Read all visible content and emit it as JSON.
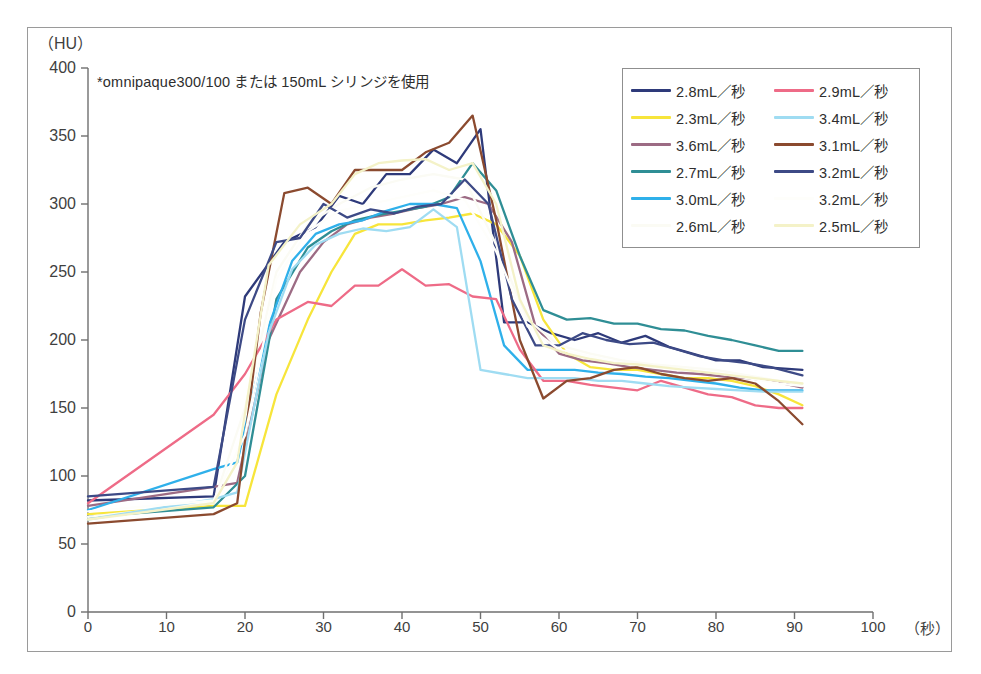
{
  "figure": {
    "annotation": "*omnipaque300/100 または 150mL シリンジを使用",
    "caption": ""
  },
  "chart_data": {
    "type": "line",
    "title": "",
    "xlabel": "（秒）",
    "ylabel": "（HU）",
    "xlim": [
      0,
      100
    ],
    "ylim": [
      0,
      400
    ],
    "xticks": [
      0,
      10,
      20,
      30,
      40,
      50,
      60,
      70,
      80,
      90,
      100
    ],
    "yticks": [
      0,
      50,
      100,
      150,
      200,
      250,
      300,
      350,
      400
    ],
    "grid": false,
    "legend_position": "top-right",
    "legend_columns": 2,
    "series": [
      {
        "name": "2.8mL／秒",
        "color": "#2e3a7a",
        "x": [
          0,
          16,
          20,
          25,
          29,
          32,
          35,
          38,
          41,
          44,
          47,
          50,
          53,
          56,
          59,
          62,
          65,
          68,
          71,
          74,
          77,
          80,
          83,
          86,
          91
        ],
        "y": [
          82,
          85,
          232,
          272,
          283,
          306,
          300,
          322,
          322,
          340,
          330,
          355,
          213,
          213,
          205,
          200,
          205,
          198,
          203,
          195,
          190,
          185,
          185,
          180,
          178
        ]
      },
      {
        "name": "2.3mL／秒",
        "color": "#f7e53b",
        "x": [
          0,
          16,
          20,
          24,
          28,
          31,
          34,
          37,
          40,
          43,
          46,
          49,
          52,
          55,
          58,
          61,
          64,
          67,
          70,
          73,
          76,
          79,
          82,
          85,
          88,
          91
        ],
        "y": [
          72,
          78,
          78,
          160,
          215,
          250,
          278,
          285,
          285,
          288,
          290,
          293,
          285,
          262,
          215,
          190,
          180,
          178,
          178,
          175,
          172,
          172,
          170,
          166,
          160,
          152
        ]
      },
      {
        "name": "3.6mL／秒",
        "color": "#9c6b84",
        "x": [
          0,
          16,
          19,
          23,
          27,
          30,
          33,
          36,
          39,
          42,
          45,
          48,
          51,
          54,
          57,
          60,
          63,
          66,
          69,
          72,
          75,
          78,
          81,
          84,
          87,
          91
        ],
        "y": [
          78,
          92,
          95,
          200,
          250,
          272,
          285,
          290,
          293,
          297,
          300,
          305,
          300,
          272,
          210,
          190,
          185,
          183,
          180,
          178,
          176,
          175,
          173,
          172,
          170,
          165
        ]
      },
      {
        "name": "2.7mL／秒",
        "color": "#2f8e95",
        "x": [
          0,
          16,
          20,
          24,
          28,
          31,
          34,
          37,
          40,
          43,
          46,
          49,
          52,
          55,
          58,
          61,
          64,
          67,
          70,
          73,
          76,
          79,
          82,
          85,
          88,
          91
        ],
        "y": [
          70,
          77,
          100,
          230,
          268,
          280,
          288,
          292,
          295,
          298,
          305,
          330,
          310,
          262,
          222,
          215,
          216,
          212,
          212,
          208,
          207,
          203,
          200,
          196,
          192,
          192
        ]
      },
      {
        "name": "3.0mL／秒",
        "color": "#2fb0ea",
        "x": [
          0,
          16,
          19,
          23,
          26,
          29,
          32,
          35,
          38,
          41,
          44,
          47,
          50,
          53,
          56,
          59,
          62,
          65,
          68,
          71,
          74,
          77,
          80,
          83,
          86,
          91
        ],
        "y": [
          75,
          105,
          110,
          210,
          258,
          278,
          285,
          288,
          295,
          300,
          300,
          297,
          258,
          196,
          178,
          178,
          178,
          176,
          175,
          173,
          172,
          170,
          168,
          165,
          163,
          163
        ]
      },
      {
        "name": "2.6mL／秒",
        "color": "#fbfbf4",
        "x": [
          0,
          16,
          20,
          24,
          28,
          32,
          36,
          40,
          44,
          48,
          52,
          56,
          60,
          64,
          68,
          72,
          76,
          80,
          84,
          88,
          91
        ],
        "y": [
          70,
          80,
          150,
          250,
          285,
          300,
          312,
          318,
          322,
          318,
          270,
          215,
          196,
          190,
          185,
          182,
          180,
          178,
          174,
          170,
          168
        ]
      },
      {
        "name": "2.9mL／秒",
        "color": "#ee6b87",
        "x": [
          0,
          16,
          20,
          24,
          28,
          31,
          34,
          37,
          40,
          43,
          46,
          49,
          52,
          55,
          58,
          61,
          64,
          67,
          70,
          73,
          76,
          79,
          82,
          85,
          88,
          91
        ],
        "y": [
          80,
          145,
          175,
          215,
          228,
          225,
          240,
          240,
          252,
          240,
          241,
          232,
          230,
          193,
          170,
          170,
          167,
          165,
          163,
          170,
          165,
          160,
          158,
          152,
          150,
          150
        ]
      },
      {
        "name": "3.4mL／秒",
        "color": "#9fdcf2",
        "x": [
          0,
          16,
          19,
          23,
          26,
          29,
          32,
          35,
          38,
          41,
          44,
          47,
          50,
          53,
          56,
          59,
          62,
          65,
          68,
          71,
          74,
          77,
          80,
          83,
          86,
          91
        ],
        "y": [
          68,
          83,
          88,
          205,
          252,
          270,
          278,
          282,
          280,
          283,
          296,
          283,
          178,
          175,
          172,
          172,
          172,
          170,
          170,
          168,
          166,
          165,
          164,
          163,
          162,
          162
        ]
      },
      {
        "name": "3.1mL／秒",
        "color": "#8b4a2f",
        "x": [
          0,
          16,
          19,
          22,
          25,
          28,
          31,
          34,
          37,
          40,
          43,
          46,
          49,
          52,
          55,
          58,
          61,
          64,
          67,
          70,
          73,
          76,
          79,
          82,
          85,
          88,
          91
        ],
        "y": [
          65,
          72,
          80,
          220,
          308,
          312,
          300,
          325,
          325,
          325,
          338,
          345,
          365,
          288,
          200,
          157,
          170,
          172,
          178,
          180,
          175,
          172,
          170,
          172,
          168,
          155,
          138
        ]
      },
      {
        "name": "3.2mL／秒",
        "color": "#3d4a86",
        "x": [
          0,
          16,
          20,
          24,
          27,
          30,
          33,
          36,
          39,
          42,
          45,
          48,
          51,
          54,
          57,
          60,
          63,
          66,
          69,
          72,
          75,
          78,
          81,
          84,
          87,
          91
        ],
        "y": [
          85,
          92,
          215,
          272,
          275,
          300,
          290,
          296,
          293,
          298,
          300,
          318,
          300,
          230,
          196,
          196,
          205,
          200,
          197,
          198,
          193,
          188,
          185,
          183,
          180,
          174
        ]
      },
      {
        "name": "3.2mL／秒",
        "color": "#fefefb",
        "x": [
          0,
          16,
          20,
          24,
          28,
          32,
          36,
          40,
          44,
          48,
          52,
          56,
          60,
          64,
          68,
          72,
          76,
          80,
          84,
          88,
          91
        ],
        "y": [
          74,
          82,
          130,
          245,
          280,
          295,
          300,
          305,
          310,
          303,
          265,
          210,
          193,
          188,
          183,
          180,
          178,
          176,
          172,
          168,
          166
        ]
      },
      {
        "name": "2.5mL／秒",
        "color": "#f4f2c8",
        "x": [
          0,
          16,
          19,
          23,
          27,
          31,
          34,
          37,
          40,
          43,
          46,
          49,
          52,
          55,
          58,
          61,
          64,
          67,
          70,
          73,
          76,
          79,
          82,
          85,
          88,
          91
        ],
        "y": [
          68,
          80,
          110,
          255,
          285,
          300,
          322,
          330,
          332,
          333,
          325,
          330,
          300,
          230,
          196,
          190,
          186,
          183,
          182,
          180,
          178,
          176,
          174,
          172,
          170,
          168
        ]
      }
    ]
  }
}
